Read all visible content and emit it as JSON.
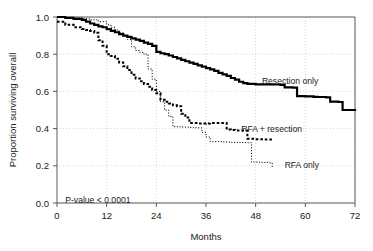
{
  "chart_data": {
    "type": "line",
    "subtype": "kaplan-meier-step",
    "title": "",
    "xlabel": "Months",
    "ylabel": "Proportion surviving overall",
    "xlim": [
      0,
      72
    ],
    "ylim": [
      0.0,
      1.0
    ],
    "xticks": [
      0,
      12,
      24,
      36,
      48,
      60,
      72
    ],
    "xtick_labels": [
      "0",
      "12",
      "24",
      "36",
      "48",
      "60",
      "72"
    ],
    "yticks": [
      0.0,
      0.2,
      0.4,
      0.6,
      0.8,
      1.0
    ],
    "ytick_labels": [
      "0.0",
      "0.2",
      "0.4",
      "0.6",
      "0.8",
      "1.0"
    ],
    "grid": true,
    "grid_style": "dotted",
    "legend": "inline-annotations",
    "annotations": [
      {
        "name": "p-value",
        "text": "P-value < 0.0001",
        "x": 2.0,
        "y": 0.015
      }
    ],
    "series": [
      {
        "name": "Resection only",
        "label": "Resection only",
        "style": "solid",
        "color": "#000000",
        "width": 2.2,
        "label_x": 49.5,
        "label_y": 0.655,
        "points": [
          [
            0,
            1.0
          ],
          [
            2,
            0.995
          ],
          [
            4,
            0.99
          ],
          [
            6,
            0.985
          ],
          [
            7,
            0.975
          ],
          [
            8,
            0.965
          ],
          [
            9,
            0.958
          ],
          [
            10,
            0.95
          ],
          [
            11,
            0.945
          ],
          [
            12,
            0.935
          ],
          [
            13,
            0.925
          ],
          [
            14,
            0.918
          ],
          [
            15,
            0.908
          ],
          [
            16,
            0.9
          ],
          [
            17,
            0.893
          ],
          [
            18,
            0.885
          ],
          [
            19,
            0.878
          ],
          [
            20,
            0.872
          ],
          [
            21,
            0.862
          ],
          [
            22,
            0.855
          ],
          [
            23,
            0.845
          ],
          [
            24,
            0.812
          ],
          [
            25,
            0.805
          ],
          [
            26,
            0.8
          ],
          [
            27,
            0.793
          ],
          [
            28,
            0.785
          ],
          [
            29,
            0.778
          ],
          [
            30,
            0.77
          ],
          [
            31,
            0.762
          ],
          [
            32,
            0.755
          ],
          [
            33,
            0.748
          ],
          [
            34,
            0.74
          ],
          [
            35,
            0.733
          ],
          [
            36,
            0.725
          ],
          [
            37,
            0.718
          ],
          [
            38,
            0.71
          ],
          [
            39,
            0.7
          ],
          [
            40,
            0.692
          ],
          [
            41,
            0.683
          ],
          [
            42,
            0.672
          ],
          [
            43,
            0.663
          ],
          [
            44,
            0.652
          ],
          [
            45,
            0.645
          ],
          [
            46,
            0.64
          ],
          [
            48,
            0.638
          ],
          [
            50,
            0.638
          ],
          [
            52,
            0.637
          ],
          [
            54,
            0.635
          ],
          [
            55,
            0.622
          ],
          [
            57,
            0.62
          ],
          [
            58,
            0.575
          ],
          [
            60,
            0.573
          ],
          [
            62,
            0.571
          ],
          [
            63,
            0.57
          ],
          [
            65,
            0.568
          ],
          [
            66,
            0.545
          ],
          [
            68,
            0.543
          ],
          [
            69,
            0.5
          ],
          [
            72,
            0.495
          ]
        ]
      },
      {
        "name": "RFA + resection",
        "label": "RFA + resection",
        "style": "dashed-bold",
        "color": "#000000",
        "width": 2.0,
        "label_x": 44.5,
        "label_y": 0.4,
        "points": [
          [
            0,
            0.975
          ],
          [
            2,
            0.958
          ],
          [
            4,
            0.945
          ],
          [
            6,
            0.935
          ],
          [
            7,
            0.93
          ],
          [
            8,
            0.925
          ],
          [
            9,
            0.915
          ],
          [
            10,
            0.875
          ],
          [
            11,
            0.845
          ],
          [
            12,
            0.8
          ],
          [
            13,
            0.79
          ],
          [
            14,
            0.775
          ],
          [
            15,
            0.755
          ],
          [
            16,
            0.735
          ],
          [
            17,
            0.715
          ],
          [
            18,
            0.69
          ],
          [
            19,
            0.67
          ],
          [
            20,
            0.655
          ],
          [
            21,
            0.64
          ],
          [
            22,
            0.625
          ],
          [
            23,
            0.608
          ],
          [
            24,
            0.59
          ],
          [
            25,
            0.555
          ],
          [
            26,
            0.545
          ],
          [
            27,
            0.535
          ],
          [
            28,
            0.525
          ],
          [
            29,
            0.52
          ],
          [
            30,
            0.48
          ],
          [
            31,
            0.46
          ],
          [
            32,
            0.43
          ],
          [
            34,
            0.428
          ],
          [
            35,
            0.427
          ],
          [
            36,
            0.428
          ],
          [
            37,
            0.43
          ],
          [
            38,
            0.43
          ],
          [
            39,
            0.43
          ],
          [
            40,
            0.43
          ],
          [
            41,
            0.395
          ],
          [
            42,
            0.392
          ],
          [
            43,
            0.39
          ],
          [
            44,
            0.39
          ],
          [
            45,
            0.39
          ],
          [
            46,
            0.345
          ],
          [
            48,
            0.343
          ],
          [
            50,
            0.342
          ],
          [
            51,
            0.342
          ],
          [
            52,
            0.34
          ]
        ]
      },
      {
        "name": "RFA only",
        "label": "RFA only",
        "style": "dotted-fine",
        "color": "#000000",
        "width": 1.0,
        "label_x": 55.0,
        "label_y": 0.205,
        "points": [
          [
            0,
            1.0
          ],
          [
            2,
            0.997
          ],
          [
            4,
            0.995
          ],
          [
            6,
            0.99
          ],
          [
            8,
            0.985
          ],
          [
            10,
            0.975
          ],
          [
            12,
            0.958
          ],
          [
            13,
            0.945
          ],
          [
            14,
            0.93
          ],
          [
            15,
            0.915
          ],
          [
            16,
            0.9
          ],
          [
            17,
            0.88
          ],
          [
            18,
            0.84
          ],
          [
            19,
            0.82
          ],
          [
            20,
            0.81
          ],
          [
            21,
            0.8
          ],
          [
            22,
            0.72
          ],
          [
            23,
            0.665
          ],
          [
            24,
            0.6
          ],
          [
            25,
            0.545
          ],
          [
            26,
            0.5
          ],
          [
            27,
            0.465
          ],
          [
            28,
            0.41
          ],
          [
            30,
            0.408
          ],
          [
            32,
            0.406
          ],
          [
            33,
            0.405
          ],
          [
            34,
            0.404
          ],
          [
            35,
            0.38
          ],
          [
            36,
            0.355
          ],
          [
            37,
            0.33
          ],
          [
            40,
            0.328
          ],
          [
            42,
            0.326
          ],
          [
            44,
            0.325
          ],
          [
            46,
            0.324
          ],
          [
            47,
            0.22
          ],
          [
            49,
            0.218
          ],
          [
            51,
            0.216
          ],
          [
            52,
            0.19
          ]
        ]
      }
    ]
  },
  "figure": {
    "background": "#ffffff",
    "axis_color": "#5a5a5a",
    "grid_color": "#b9b9b9",
    "curve_color": "#000000"
  }
}
